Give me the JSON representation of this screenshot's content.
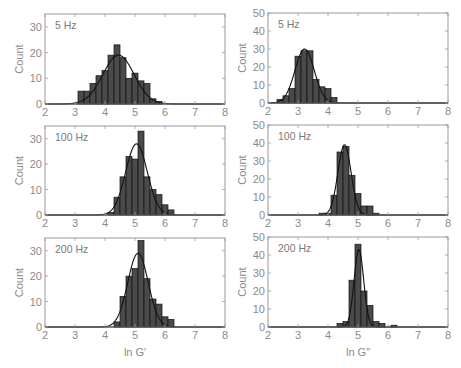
{
  "chart_data": [
    {
      "type": "bar",
      "panel": "top-left",
      "label": "5 Hz",
      "xlabel": "",
      "ylabel": "Count",
      "xlim": [
        2,
        8
      ],
      "ylim": [
        0,
        35
      ],
      "xticks": [
        2,
        3,
        4,
        5,
        6,
        7,
        8
      ],
      "yticks": [
        0,
        10,
        20,
        30
      ],
      "bin_width": 0.2,
      "bin_starts": [
        3.1,
        3.3,
        3.5,
        3.7,
        3.9,
        4.1,
        4.3,
        4.5,
        4.7,
        4.9,
        5.1,
        5.3,
        5.5,
        5.7
      ],
      "values": [
        5,
        5,
        8,
        11,
        13,
        19,
        23,
        18,
        10,
        12,
        9,
        8,
        2,
        1
      ],
      "fit": {
        "type": "gaussian",
        "mean": 4.45,
        "sd": 0.52,
        "peak": 19
      }
    },
    {
      "type": "bar",
      "panel": "top-right",
      "label": "5 Hz",
      "xlabel": "",
      "ylabel": "Count",
      "xlim": [
        2,
        8
      ],
      "ylim": [
        0,
        50
      ],
      "xticks": [
        2,
        3,
        4,
        5,
        6,
        7,
        8
      ],
      "yticks": [
        0,
        10,
        20,
        30,
        40,
        50
      ],
      "bin_width": 0.2,
      "bin_starts": [
        2.3,
        2.5,
        2.7,
        2.9,
        3.1,
        3.3,
        3.5,
        3.7,
        3.9,
        4.1
      ],
      "values": [
        2,
        4,
        8,
        26,
        29,
        29,
        13,
        9,
        8,
        3
      ],
      "fit": {
        "type": "gaussian",
        "mean": 3.22,
        "sd": 0.32,
        "peak": 30
      }
    },
    {
      "type": "bar",
      "panel": "middle-left",
      "label": "100 Hz",
      "xlabel": "",
      "ylabel": "Count",
      "xlim": [
        2,
        8
      ],
      "ylim": [
        0,
        35
      ],
      "xticks": [
        2,
        3,
        4,
        5,
        6,
        7,
        8
      ],
      "yticks": [
        0,
        10,
        20,
        30
      ],
      "bin_width": 0.2,
      "bin_starts": [
        4.1,
        4.3,
        4.5,
        4.7,
        4.9,
        5.1,
        5.3,
        5.5,
        5.7,
        5.9,
        6.1
      ],
      "values": [
        1,
        7,
        15,
        23,
        22,
        33,
        15,
        10,
        8,
        4,
        2
      ],
      "fit": {
        "type": "gaussian",
        "mean": 5.05,
        "sd": 0.36,
        "peak": 28
      }
    },
    {
      "type": "bar",
      "panel": "middle-right",
      "label": "100 Hz",
      "xlabel": "",
      "ylabel": "Count",
      "xlim": [
        2,
        8
      ],
      "ylim": [
        0,
        50
      ],
      "xticks": [
        2,
        3,
        4,
        5,
        6,
        7,
        8
      ],
      "yticks": [
        0,
        10,
        20,
        30,
        40,
        50
      ],
      "bin_width": 0.2,
      "bin_starts": [
        3.7,
        3.9,
        4.1,
        4.3,
        4.5,
        4.7,
        4.9,
        5.1,
        5.3,
        5.5
      ],
      "values": [
        1,
        1,
        11,
        35,
        38,
        22,
        12,
        5,
        5,
        1
      ],
      "fit": {
        "type": "gaussian",
        "mean": 4.55,
        "sd": 0.22,
        "peak": 39
      }
    },
    {
      "type": "bar",
      "panel": "bottom-left",
      "label": "200 Hz",
      "xlabel": "ln G′",
      "ylabel": "Count",
      "xlim": [
        2,
        8
      ],
      "ylim": [
        0,
        35
      ],
      "xticks": [
        2,
        3,
        4,
        5,
        6,
        7,
        8
      ],
      "yticks": [
        0,
        10,
        20,
        30
      ],
      "bin_width": 0.2,
      "bin_starts": [
        4.3,
        4.5,
        4.7,
        4.9,
        5.1,
        5.3,
        5.5,
        5.7,
        5.9,
        6.1
      ],
      "values": [
        2,
        12,
        20,
        23,
        34,
        19,
        11,
        9,
        4,
        3
      ],
      "fit": {
        "type": "gaussian",
        "mean": 5.1,
        "sd": 0.34,
        "peak": 29
      }
    },
    {
      "type": "bar",
      "panel": "bottom-right",
      "label": "200 Hz",
      "xlabel": "ln G″",
      "ylabel": "Count",
      "xlim": [
        2,
        8
      ],
      "ylim": [
        0,
        50
      ],
      "xticks": [
        2,
        3,
        4,
        5,
        6,
        7,
        8
      ],
      "yticks": [
        0,
        10,
        20,
        30,
        40,
        50
      ],
      "bin_width": 0.2,
      "bin_starts": [
        4.3,
        4.5,
        4.7,
        4.9,
        5.1,
        5.3,
        5.5,
        5.7,
        5.9,
        6.1
      ],
      "values": [
        2,
        3,
        26,
        46,
        20,
        12,
        3,
        2,
        0,
        1
      ],
      "fit": {
        "type": "gaussian",
        "mean": 5.03,
        "sd": 0.16,
        "peak": 43
      }
    }
  ],
  "style": {
    "bar_fill": "#4a4a4a",
    "bar_edge": "#111111",
    "fit_color": "#111111",
    "frame_color": "#9a9a9a",
    "text_color": "#8a8a8a"
  }
}
